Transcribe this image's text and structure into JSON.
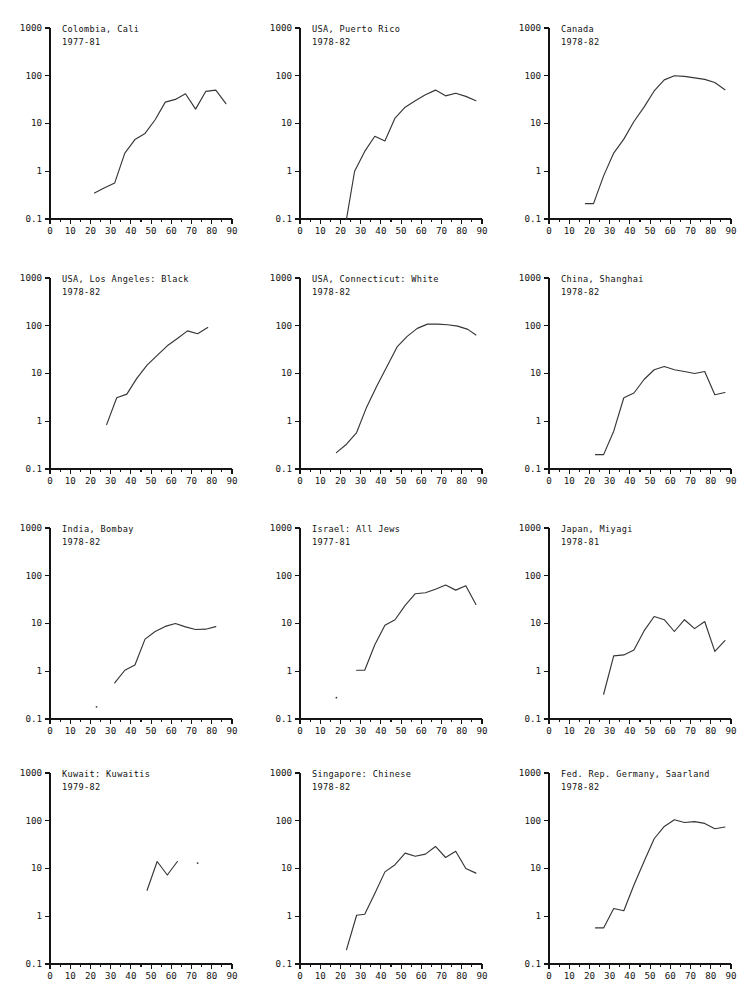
{
  "figure": {
    "name": "age-specific-incidence-rate-small-multiples",
    "panel_rows": 4,
    "panel_cols": 3,
    "line_color": "#363636",
    "axis_color": "#141414",
    "background": "#ffffff"
  },
  "axes": {
    "x": {
      "label": "",
      "min": 0,
      "max": 90,
      "scale": "linear",
      "major_ticks": [
        0,
        10,
        20,
        30,
        40,
        50,
        60,
        70,
        80,
        90
      ],
      "tick_labels": [
        "0",
        "10",
        "20",
        "30",
        "40",
        "50",
        "60",
        "70",
        "80",
        "90"
      ],
      "minor_tick_step": 5,
      "grid": false
    },
    "y": {
      "label": "",
      "min": 0.1,
      "max": 1000,
      "scale": "log",
      "major_ticks": [
        0.1,
        1,
        10,
        100,
        1000
      ],
      "tick_labels": [
        "0.1",
        "1",
        "10",
        "100",
        "1000"
      ],
      "grid": false
    }
  },
  "chart_data": [
    {
      "type": "line",
      "title": "Colombia, Cali",
      "subtitle": "1977-81",
      "xlabel": "",
      "ylabel": "",
      "xlim": [
        0,
        90
      ],
      "ylim": [
        0.1,
        1000
      ],
      "yscale": "log",
      "grid": false,
      "legend": "none",
      "x": [
        22,
        27,
        32,
        37,
        42,
        47,
        52,
        57,
        62,
        67,
        72,
        77,
        82,
        87
      ],
      "values": [
        0.35,
        0.45,
        0.57,
        2.4,
        4.6,
        6.2,
        12,
        28,
        32,
        42,
        20,
        47,
        50,
        26
      ]
    },
    {
      "type": "line",
      "title": "USA, Puerto Rico",
      "subtitle": "1978-82",
      "xlabel": "",
      "ylabel": "",
      "xlim": [
        0,
        90
      ],
      "ylim": [
        0.1,
        1000
      ],
      "yscale": "log",
      "grid": false,
      "legend": "none",
      "x": [
        23,
        27,
        32,
        37,
        42,
        47,
        52,
        57,
        62,
        67,
        72,
        77,
        82,
        87
      ],
      "values": [
        0.1,
        1.0,
        2.6,
        5.4,
        4.3,
        13,
        22,
        30,
        40,
        50,
        38,
        43,
        37,
        30
      ]
    },
    {
      "type": "line",
      "title": "Canada",
      "subtitle": "1978-82",
      "xlabel": "",
      "ylabel": "",
      "xlim": [
        0,
        90
      ],
      "ylim": [
        0.1,
        1000
      ],
      "yscale": "log",
      "grid": false,
      "legend": "none",
      "x": [
        18,
        22,
        27,
        32,
        37,
        42,
        47,
        52,
        57,
        62,
        67,
        72,
        77,
        82,
        87
      ],
      "values": [
        0.21,
        0.21,
        0.8,
        2.4,
        4.7,
        11,
        22,
        48,
        82,
        100,
        97,
        90,
        84,
        72,
        51
      ]
    },
    {
      "type": "line",
      "title": "USA, Los Angeles: Black",
      "subtitle": "1978-82",
      "xlabel": "",
      "ylabel": "",
      "xlim": [
        0,
        90
      ],
      "ylim": [
        0.1,
        1000
      ],
      "yscale": "log",
      "grid": false,
      "legend": "none",
      "x": [
        28,
        33,
        38,
        43,
        48,
        53,
        58,
        63,
        68,
        73,
        78
      ],
      "values": [
        0.85,
        3.1,
        3.7,
        8.0,
        15,
        24,
        38,
        54,
        78,
        68,
        92
      ]
    },
    {
      "type": "line",
      "title": "USA, Connecticut: White",
      "subtitle": "1978-82",
      "xlabel": "",
      "ylabel": "",
      "xlim": [
        0,
        90
      ],
      "ylim": [
        0.1,
        1000
      ],
      "yscale": "log",
      "grid": false,
      "legend": "none",
      "x": [
        18,
        23,
        28,
        33,
        38,
        43,
        48,
        53,
        58,
        63,
        68,
        73,
        78,
        83,
        87
      ],
      "values": [
        0.22,
        0.33,
        0.58,
        2.0,
        5.5,
        14,
        36,
        60,
        88,
        108,
        108,
        105,
        98,
        84,
        64
      ]
    },
    {
      "type": "line",
      "title": "China, Shanghai",
      "subtitle": "1978-82",
      "xlabel": "",
      "ylabel": "",
      "xlim": [
        0,
        90
      ],
      "ylim": [
        0.1,
        1000
      ],
      "yscale": "log",
      "grid": false,
      "legend": "none",
      "x": [
        23,
        27,
        32,
        37,
        42,
        47,
        52,
        57,
        62,
        67,
        72,
        77,
        82,
        87
      ],
      "values": [
        0.2,
        0.2,
        0.62,
        3.1,
        3.9,
        7.5,
        12,
        14,
        12,
        11,
        10,
        11,
        3.6,
        4.0
      ]
    },
    {
      "type": "line",
      "title": "India, Bombay",
      "subtitle": "1978-82",
      "xlabel": "",
      "ylabel": "",
      "xlim": [
        0,
        90
      ],
      "ylim": [
        0.1,
        1000
      ],
      "yscale": "log",
      "grid": false,
      "legend": "none",
      "x": [
        32,
        37,
        42,
        47,
        52,
        57,
        62,
        67,
        72,
        77,
        82
      ],
      "values": [
        0.57,
        1.05,
        1.35,
        4.7,
        6.8,
        8.7,
        10,
        8.5,
        7.5,
        7.6,
        8.6
      ],
      "isolated_points": [
        {
          "x": 23,
          "y": 0.18
        }
      ]
    },
    {
      "type": "line",
      "title": "Israel: All Jews",
      "subtitle": "1977-81",
      "xlabel": "",
      "ylabel": "",
      "xlim": [
        0,
        90
      ],
      "ylim": [
        0.1,
        1000
      ],
      "yscale": "log",
      "grid": false,
      "legend": "none",
      "x": [
        28,
        32,
        37,
        42,
        47,
        52,
        57,
        62,
        67,
        72,
        77,
        82,
        87
      ],
      "values": [
        1.05,
        1.05,
        3.6,
        9.2,
        12,
        24,
        42,
        44,
        52,
        64,
        50,
        62,
        25
      ],
      "isolated_points": [
        {
          "x": 18,
          "y": 0.28
        }
      ]
    },
    {
      "type": "line",
      "title": "Japan, Miyagi",
      "subtitle": "1978-81",
      "xlabel": "",
      "ylabel": "",
      "xlim": [
        0,
        90
      ],
      "ylim": [
        0.1,
        1000
      ],
      "yscale": "log",
      "grid": false,
      "legend": "none",
      "x": [
        27,
        32,
        37,
        42,
        47,
        52,
        57,
        62,
        67,
        72,
        77,
        82,
        87
      ],
      "values": [
        0.33,
        2.1,
        2.2,
        2.8,
        7.0,
        14,
        12,
        6.8,
        12,
        7.8,
        11,
        2.6,
        4.4
      ]
    },
    {
      "type": "line",
      "title": "Kuwait: Kuwaitis",
      "subtitle": "1979-82",
      "xlabel": "",
      "ylabel": "",
      "xlim": [
        0,
        90
      ],
      "ylim": [
        0.1,
        1000
      ],
      "yscale": "log",
      "grid": false,
      "legend": "none",
      "x": [
        48,
        53,
        58,
        63
      ],
      "values": [
        3.5,
        14,
        7.3,
        14
      ],
      "isolated_points": [
        {
          "x": 73,
          "y": 13
        }
      ]
    },
    {
      "type": "line",
      "title": "Singapore: Chinese",
      "subtitle": "1978-82",
      "xlabel": "",
      "ylabel": "",
      "xlim": [
        0,
        90
      ],
      "ylim": [
        0.1,
        1000
      ],
      "yscale": "log",
      "grid": false,
      "legend": "none",
      "x": [
        23,
        28,
        32,
        37,
        42,
        47,
        52,
        57,
        62,
        67,
        72,
        77,
        82,
        87
      ],
      "values": [
        0.2,
        1.05,
        1.1,
        3.0,
        8.5,
        12,
        21,
        18,
        20,
        29,
        17,
        23,
        10,
        8.0
      ]
    },
    {
      "type": "line",
      "title": "Fed. Rep. Germany, Saarland",
      "subtitle": "1978-82",
      "xlabel": "",
      "ylabel": "",
      "xlim": [
        0,
        90
      ],
      "ylim": [
        0.1,
        1000
      ],
      "yscale": "log",
      "grid": false,
      "legend": "none",
      "x": [
        23,
        27,
        32,
        37,
        42,
        47,
        52,
        57,
        62,
        67,
        72,
        77,
        82,
        87
      ],
      "values": [
        0.57,
        0.57,
        1.45,
        1.3,
        4.5,
        14,
        42,
        76,
        105,
        92,
        96,
        88,
        68,
        74
      ]
    }
  ]
}
